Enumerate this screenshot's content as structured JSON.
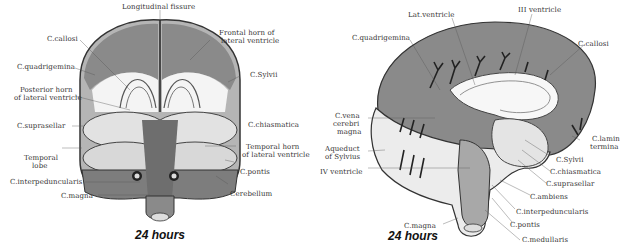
{
  "figures": [
    {
      "id": "left",
      "view": "coronal",
      "caption": "24 hours",
      "labels": {
        "longitudinal_fissure": "Longitudinal fissure",
        "frontal_horn_1": "Frontal horn of",
        "frontal_horn_2": "lateral ventricle",
        "c_callosi": "C.callosi",
        "c_quadrigemina": "C.quadrigemina",
        "c_sylvii": "C.Sylvii",
        "posterior_horn_1": "Posterior horn",
        "posterior_horn_2": "of lateral ventricle",
        "c_suprasellar": "C.suprasellar",
        "c_chiasmatica": "C.chiasmatica",
        "temporal_lobe_1": "Temporal",
        "temporal_lobe_2": "lobe",
        "temporal_horn_1": "Temporal horn",
        "temporal_horn_2": "of lateral ventricle",
        "c_pontis": "C.pontis",
        "c_interpeduncularis": "C.interpeduncularis",
        "cerebellum": "Cerebellum",
        "c_magna": "C.magna"
      }
    },
    {
      "id": "right",
      "view": "sagittal",
      "caption": "24 hours",
      "labels": {
        "lat_ventricle": "Lat.ventricle",
        "iii_ventricle": "III ventricle",
        "c_quadrigemina": "C.quadrigemina",
        "c_callosi": "C.callosi",
        "c_vena_1": "C.vena",
        "c_vena_2": "cerebri",
        "c_vena_3": "magna",
        "c_lamina_1": "C.lamin",
        "c_lamina_2": "termina",
        "aqueduct_1": "Aqueduct",
        "aqueduct_2": "of Sylvius",
        "c_sylvii": "C.Sylvii",
        "iv_ventricle": "IV ventricle",
        "c_chiasmatica": "C.chiasmatica",
        "c_suprasellar": "C.suprasellar",
        "c_ambiens": "C.ambiens",
        "c_interpeduncularis": "C.interpeduncularis",
        "c_magna": "C.magna",
        "c_pontis": "C.pontis",
        "c_medullaris": "C.medullaris"
      }
    }
  ],
  "colors": {
    "cistern_fill": "#8a8a8a",
    "tissue_light": "#e8e8e8",
    "tissue_mid": "#b8b8b8",
    "ink": "#333333"
  }
}
